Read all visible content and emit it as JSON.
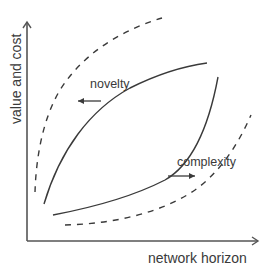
{
  "diagram": {
    "axes": {
      "x_label": "network horizon",
      "y_label": "value and cost",
      "color": "#555555"
    },
    "curves": [
      {
        "name": "novelty-inner",
        "style": "solid",
        "description": "concave curve rising steeply then flattening"
      },
      {
        "name": "complexity-inner",
        "style": "solid",
        "description": "convex curve rising slowly then steeply"
      },
      {
        "name": "novelty-outer",
        "style": "dashed",
        "description": "shifted concave curve (upper-left)"
      },
      {
        "name": "complexity-outer",
        "style": "dashed",
        "description": "shifted convex curve (lower-right)"
      }
    ],
    "annotations": {
      "novelty": {
        "label": "novelty",
        "arrow_direction": "left"
      },
      "complexity": {
        "label": "complexity",
        "arrow_direction": "right"
      }
    },
    "line_color": "#3a3a3a"
  }
}
